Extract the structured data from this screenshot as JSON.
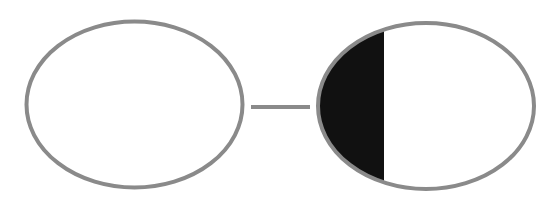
{
  "diagram": {
    "colors": {
      "stroke": "#8a8a8a",
      "fill_dark": "#111111",
      "background": "#ffffff",
      "ellipse_fill": "#ffffff"
    },
    "nodes": [
      {
        "id": "left-ellipse",
        "cx": 134.5,
        "cy": 104.5,
        "rx": 108,
        "ry": 83,
        "filled_fraction": 0
      },
      {
        "id": "right-ellipse",
        "cx": 426,
        "cy": 106,
        "rx": 108,
        "ry": 83,
        "filled_fraction": 0.3
      }
    ],
    "edges": [
      {
        "id": "connector",
        "from": "left-ellipse",
        "to": "right-ellipse",
        "x1": 251,
        "y1": 107,
        "x2": 310,
        "y2": 107
      }
    ],
    "fill_split_x": 384
  }
}
